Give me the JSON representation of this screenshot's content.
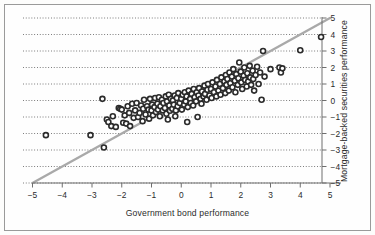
{
  "figure": {
    "x_axis_label": "Government bond performance",
    "y_axis_label": "Mortgage-backed securities performance",
    "frame_color": "#9a9a9a",
    "marker_color": "#2b2b2b",
    "marker_fill": "#ffffff",
    "reference_line_color": "#a9a9a9",
    "gridline_color": "#555555",
    "background": "#fefefe"
  },
  "chart_data": {
    "type": "scatter",
    "title": "",
    "xlabel": "Government bond performance",
    "ylabel": "Mortgage-backed securities performance",
    "xlim": [
      -5,
      5
    ],
    "ylim": [
      -5,
      5
    ],
    "xticks": [
      -5,
      -4,
      -3,
      -2,
      -1,
      0,
      1,
      2,
      3,
      4,
      5
    ],
    "yticks": [
      -5,
      -4,
      -3,
      -2,
      -1,
      0,
      1,
      2,
      3,
      4,
      5
    ],
    "xtick_labels": [
      "−5",
      "−4",
      "−3",
      "−2",
      "−1",
      "0",
      "1",
      "2",
      "3",
      "4",
      "5"
    ],
    "ytick_labels": [
      "−5",
      "−4",
      "−3",
      "−2",
      "−1",
      "0",
      "1",
      "2",
      "3",
      "4",
      "5"
    ],
    "grid": "horizontal-dotted",
    "y_axis_position": "right",
    "legend": "none",
    "annotations": [],
    "reference_line": {
      "type": "identity",
      "from": [
        -5,
        -5
      ],
      "to": [
        5,
        5
      ],
      "color": "#a9a9a9",
      "width": 2.4
    },
    "series": [
      {
        "name": "Monthly returns",
        "marker": "open-circle",
        "points": [
          [
            -4.55,
            -2.1
          ],
          [
            -3.05,
            -2.1
          ],
          [
            -2.6,
            -2.85
          ],
          [
            -2.65,
            0.1
          ],
          [
            -2.5,
            -1.15
          ],
          [
            -2.45,
            -1.3
          ],
          [
            -2.35,
            -1.55
          ],
          [
            -2.3,
            -0.95
          ],
          [
            -2.2,
            -1.6
          ],
          [
            -2.1,
            -0.45
          ],
          [
            -2.05,
            -0.5
          ],
          [
            -2.0,
            -0.55
          ],
          [
            -1.95,
            -1.35
          ],
          [
            -1.9,
            -0.9
          ],
          [
            -1.85,
            -1.4
          ],
          [
            -1.8,
            -0.35
          ],
          [
            -1.75,
            -0.75
          ],
          [
            -1.72,
            -1.55
          ],
          [
            -1.65,
            -0.2
          ],
          [
            -1.6,
            -1.05
          ],
          [
            -1.55,
            -0.6
          ],
          [
            -1.5,
            -0.15
          ],
          [
            -1.45,
            -1.0
          ],
          [
            -1.4,
            -0.75
          ],
          [
            -1.35,
            -0.3
          ],
          [
            -1.3,
            -1.25
          ],
          [
            -1.28,
            -0.5
          ],
          [
            -1.25,
            0.05
          ],
          [
            -1.2,
            -0.85
          ],
          [
            -1.15,
            -0.35
          ],
          [
            -1.1,
            -0.55
          ],
          [
            -1.08,
            -1.1
          ],
          [
            -1.05,
            0.1
          ],
          [
            -1.0,
            -0.6
          ],
          [
            -0.98,
            -0.25
          ],
          [
            -0.95,
            -0.9
          ],
          [
            -0.9,
            -0.4
          ],
          [
            -0.88,
            0.15
          ],
          [
            -0.85,
            -0.7
          ],
          [
            -0.8,
            -0.2
          ],
          [
            -0.78,
            -0.55
          ],
          [
            -0.75,
            0.2
          ],
          [
            -0.72,
            -0.95
          ],
          [
            -0.7,
            -0.35
          ],
          [
            -0.65,
            0.05
          ],
          [
            -0.62,
            -0.6
          ],
          [
            -0.6,
            -0.15
          ],
          [
            -0.55,
            -0.45
          ],
          [
            -0.52,
            0.25
          ],
          [
            -0.5,
            -0.8
          ],
          [
            -0.48,
            -0.05
          ],
          [
            -0.45,
            -1.15
          ],
          [
            -0.42,
            0.35
          ],
          [
            -0.4,
            -0.3
          ],
          [
            -0.38,
            -0.62
          ],
          [
            -0.35,
            0.1
          ],
          [
            -0.3,
            -0.5
          ],
          [
            -0.28,
            0.0
          ],
          [
            -0.25,
            -0.25
          ],
          [
            -0.22,
            0.3
          ],
          [
            -0.2,
            -0.95
          ],
          [
            -0.18,
            -0.6
          ],
          [
            -0.15,
            0.15
          ],
          [
            -0.12,
            -0.35
          ],
          [
            -0.1,
            0.45
          ],
          [
            -0.05,
            -0.15
          ],
          [
            0.0,
            0.1
          ],
          [
            0.02,
            -0.55
          ],
          [
            0.05,
            0.35
          ],
          [
            0.1,
            -0.25
          ],
          [
            0.12,
            0.5
          ],
          [
            0.15,
            -0.05
          ],
          [
            0.18,
            0.25
          ],
          [
            0.2,
            -1.3
          ],
          [
            0.22,
            -0.4
          ],
          [
            0.25,
            0.6
          ],
          [
            0.3,
            0.1
          ],
          [
            0.32,
            -0.15
          ],
          [
            0.35,
            0.4
          ],
          [
            0.4,
            -0.3
          ],
          [
            0.42,
            0.7
          ],
          [
            0.45,
            0.2
          ],
          [
            0.5,
            -0.05
          ],
          [
            0.52,
            0.5
          ],
          [
            0.55,
            -1.0
          ],
          [
            0.58,
            0.3
          ],
          [
            0.6,
            0.75
          ],
          [
            0.65,
            0.1
          ],
          [
            0.68,
            -0.2
          ],
          [
            0.7,
            0.55
          ],
          [
            0.75,
            0.25
          ],
          [
            0.78,
            0.9
          ],
          [
            0.8,
            0.4
          ],
          [
            0.85,
            0.05
          ],
          [
            0.88,
            0.65
          ],
          [
            0.9,
            1.0
          ],
          [
            0.95,
            0.3
          ],
          [
            1.0,
            0.7
          ],
          [
            1.02,
            0.15
          ],
          [
            1.05,
            1.1
          ],
          [
            1.1,
            0.5
          ],
          [
            1.15,
            0.85
          ],
          [
            1.18,
            0.25
          ],
          [
            1.2,
            1.25
          ],
          [
            1.25,
            0.6
          ],
          [
            1.3,
            1.0
          ],
          [
            1.32,
            0.35
          ],
          [
            1.35,
            1.4
          ],
          [
            1.4,
            0.75
          ],
          [
            1.45,
            1.15
          ],
          [
            1.48,
            0.45
          ],
          [
            1.5,
            1.55
          ],
          [
            1.52,
            0.95
          ],
          [
            1.55,
            1.3
          ],
          [
            1.6,
            0.6
          ],
          [
            1.62,
            1.7
          ],
          [
            1.65,
            1.05
          ],
          [
            1.7,
            1.45
          ],
          [
            1.72,
            0.8
          ],
          [
            1.75,
            1.9
          ],
          [
            1.8,
            1.2
          ],
          [
            1.82,
            0.5
          ],
          [
            1.85,
            1.6
          ],
          [
            1.9,
            0.95
          ],
          [
            1.92,
            1.35
          ],
          [
            1.95,
            2.3
          ],
          [
            2.0,
            1.75
          ],
          [
            2.02,
            1.1
          ],
          [
            2.05,
            0.7
          ],
          [
            2.1,
            1.5
          ],
          [
            2.12,
            2.0
          ],
          [
            2.15,
            1.25
          ],
          [
            2.2,
            0.85
          ],
          [
            2.22,
            1.65
          ],
          [
            2.25,
            1.15
          ],
          [
            2.3,
            2.1
          ],
          [
            2.32,
            1.4
          ],
          [
            2.35,
            0.95
          ],
          [
            2.4,
            1.8
          ],
          [
            2.42,
            1.3
          ],
          [
            2.45,
            0.6
          ],
          [
            2.5,
            1.55
          ],
          [
            2.55,
            2.05
          ],
          [
            2.6,
            1.0
          ],
          [
            2.65,
            1.7
          ],
          [
            2.7,
            0.05
          ],
          [
            2.75,
            3.0
          ],
          [
            2.8,
            1.45
          ],
          [
            3.0,
            1.9
          ],
          [
            3.3,
            2.0
          ],
          [
            3.35,
            1.7
          ],
          [
            3.4,
            1.95
          ],
          [
            4.0,
            3.05
          ],
          [
            4.7,
            3.85
          ]
        ]
      }
    ]
  }
}
